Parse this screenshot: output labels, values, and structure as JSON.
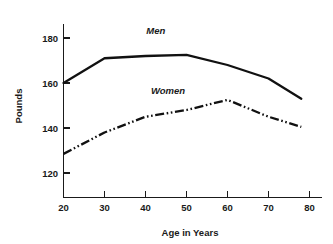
{
  "chart_data": {
    "type": "line",
    "title": "",
    "xlabel": "Age in Years",
    "ylabel": "Pounds",
    "xlim": [
      18,
      82
    ],
    "ylim": [
      112,
      188
    ],
    "xticks": [
      20,
      30,
      40,
      50,
      60,
      70,
      80
    ],
    "xtick_labels": [
      "20",
      "30",
      "40",
      "50",
      "60",
      "70",
      "80"
    ],
    "yticks": [
      120,
      140,
      160,
      180
    ],
    "ytick_labels": [
      "120",
      "140",
      "160",
      "180"
    ],
    "grid": false,
    "legend_position": "inline-annotation",
    "x": [
      20,
      30,
      40,
      50,
      60,
      70,
      78
    ],
    "series": [
      {
        "name": "Men",
        "style": "solid",
        "color": "#111111",
        "values": [
          160,
          171,
          172,
          172.5,
          168,
          162,
          153
        ]
      },
      {
        "name": "Women",
        "style": "dash-dot-dot",
        "color": "#111111",
        "values": [
          128.5,
          138,
          145,
          148,
          152.5,
          145,
          140.5
        ]
      }
    ],
    "annotations": [
      {
        "text": "Men",
        "x": 42.5,
        "y": 182
      },
      {
        "text": "Women",
        "x": 45.5,
        "y": 155
      }
    ]
  },
  "axes": {
    "y_axis_title": "Pounds",
    "x_axis_title": "Age in Years",
    "y_tick_0": "120",
    "y_tick_1": "140",
    "y_tick_2": "160",
    "y_tick_3": "180",
    "x_tick_0": "20",
    "x_tick_1": "30",
    "x_tick_2": "40",
    "x_tick_3": "50",
    "x_tick_4": "60",
    "x_tick_5": "70",
    "x_tick_6": "80"
  },
  "labels": {
    "men": "Men",
    "women": "Women"
  },
  "colors": {
    "line": "#111111",
    "axis": "#1a1a1a",
    "background": "#ffffff"
  }
}
